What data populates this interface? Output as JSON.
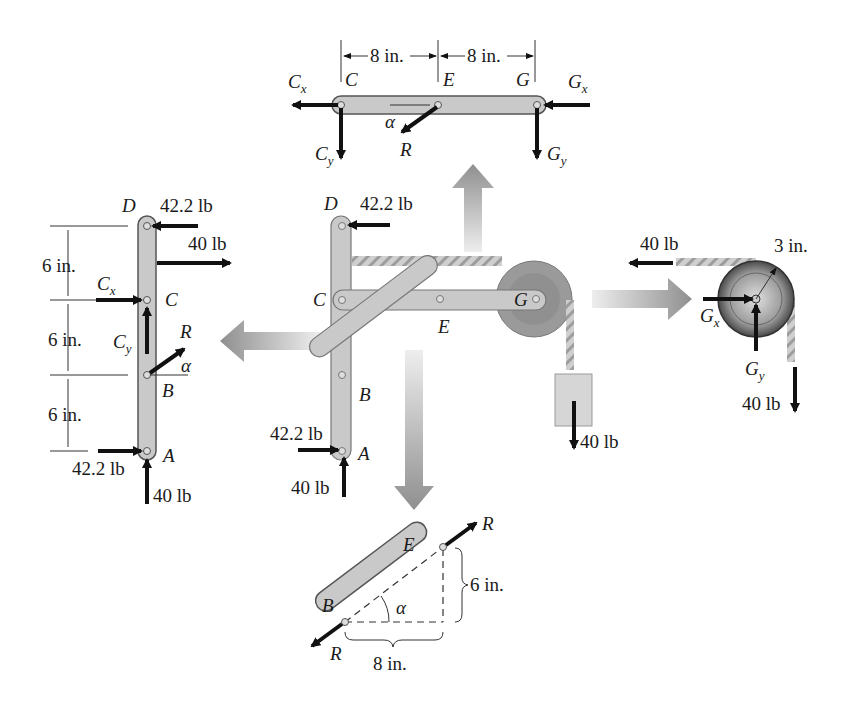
{
  "figure": {
    "type": "free-body diagram of frame with pulley",
    "colors": {
      "member_fill": "#c9c9c9",
      "member_stroke": "#6e6e6e",
      "force_arrow": "#111111",
      "big_arrow": "#9a9a9a",
      "rope": "#b5b5b5",
      "pulley": "#8c8c8c"
    }
  },
  "member_CEG": {
    "dims": [
      "8 in.",
      "8 in."
    ],
    "points": {
      "C": "C",
      "E": "E",
      "G": "G"
    },
    "forces": {
      "Cx": "C",
      "Cx_sub": "x",
      "Cy": "C",
      "Cy_sub": "y",
      "Gx": "G",
      "Gx_sub": "x",
      "Gy": "G",
      "Gy_sub": "y",
      "R": "R",
      "alpha": "α"
    }
  },
  "member_ABCD": {
    "dims": [
      "6 in.",
      "6 in.",
      "6 in."
    ],
    "points": {
      "A": "A",
      "B": "B",
      "C": "C",
      "D": "D"
    },
    "forces": {
      "D_force": "42.2 lb",
      "rope_force": "40 lb",
      "Cx": "C",
      "Cx_sub": "x",
      "Cy": "C",
      "Cy_sub": "y",
      "R": "R",
      "alpha": "α",
      "A_horizontal": "42.2 lb",
      "A_vertical": "40 lb"
    }
  },
  "assembly": {
    "points": {
      "A": "A",
      "B": "B",
      "C": "C",
      "D": "D",
      "E": "E",
      "G": "G"
    },
    "forces": {
      "D_force": "42.2 lb",
      "A_horizontal": "42.2 lb",
      "A_vertical": "40 lb",
      "weight": "40 lb"
    }
  },
  "pulley": {
    "radius": "3 in.",
    "forces": {
      "rope_left": "40 lb",
      "rope_down": "40 lb",
      "Gx": "G",
      "Gx_sub": "x",
      "Gy": "G",
      "Gy_sub": "y"
    }
  },
  "member_BE": {
    "points": {
      "B": "B",
      "E": "E"
    },
    "forces": {
      "R_top": "R",
      "R_bottom": "R",
      "alpha": "α"
    },
    "dims": {
      "vertical": "6 in.",
      "horizontal": "8 in."
    }
  }
}
